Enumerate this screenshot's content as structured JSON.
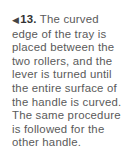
{
  "caption": {
    "arrow_icon": "◀",
    "step_number": "13.",
    "lines": [
      " The curved",
      "edge of the tray is",
      "placed between the",
      "two rollers, and the",
      "lever is turned until",
      "the entire surface of",
      "the handle is curved.",
      "The same procedure",
      "is followed for the",
      "other handle."
    ]
  },
  "colors": {
    "text": "#5a5a5a",
    "step_number": "#333333",
    "background": "#ffffff"
  }
}
